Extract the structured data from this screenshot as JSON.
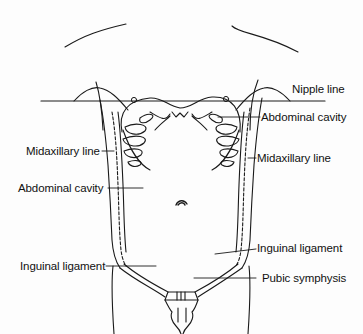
{
  "diagram": {
    "stroke_color": "#1a1a1a",
    "background": "#fdfdfd",
    "labels": {
      "nipple_line": "Nipple line",
      "abdominal_cavity_right": "Abdominal cavity",
      "midaxillary_line_left": "Midaxillary line",
      "midaxillary_line_right": "Midaxillary line",
      "abdominal_cavity_left": "Abdominal cavity",
      "inguinal_ligament_right": "Inguinal ligament",
      "inguinal_ligament_left": "Inguinal ligament",
      "pubic_symphysis": "Pubic symphysis"
    }
  }
}
